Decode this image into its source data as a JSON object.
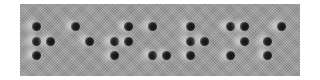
{
  "braille": {
    "text": "returns",
    "panel_color": "#9a9a9a",
    "dot_color": "#111111",
    "cells": [
      {
        "letter": "r",
        "dots": [
          1,
          2,
          3,
          5
        ],
        "x": 12
      },
      {
        "letter": "e",
        "dots": [
          1,
          5
        ],
        "x": 51
      },
      {
        "letter": "t",
        "dots": [
          2,
          3,
          4,
          5
        ],
        "x": 90
      },
      {
        "letter": "u",
        "dots": [
          1,
          3,
          6
        ],
        "x": 128
      },
      {
        "letter": "r",
        "dots": [
          1,
          2,
          3,
          5
        ],
        "x": 166
      },
      {
        "letter": "n",
        "dots": [
          1,
          3,
          4,
          5
        ],
        "x": 206
      },
      {
        "letter": "s",
        "dots": [
          2,
          3,
          4
        ],
        "x": 243
      }
    ]
  }
}
